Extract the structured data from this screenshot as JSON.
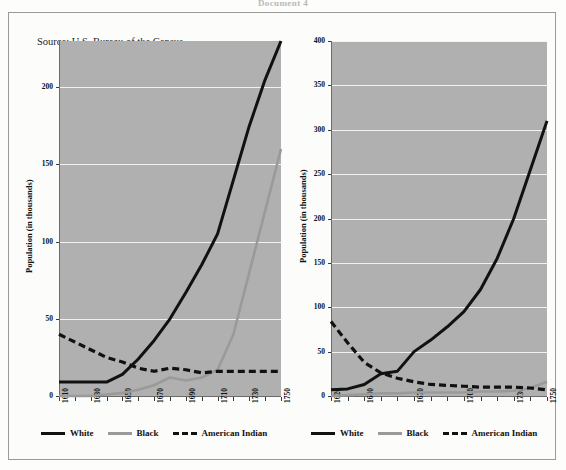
{
  "document": {
    "header": "Document 4",
    "source": "Source: U.S. Bureau of the Census"
  },
  "legend": {
    "items": [
      {
        "label": "White",
        "style": "solid-black",
        "color": "#111111"
      },
      {
        "label": "Black",
        "style": "solid-gray",
        "color": "#9a9a9a"
      },
      {
        "label": "American Indian",
        "style": "dashed-black",
        "color": "#111111"
      }
    ]
  },
  "chart_data": [
    {
      "id": "left-chart",
      "type": "line",
      "title": "",
      "xlabel": "",
      "ylabel": "Population (in thousands)",
      "xlim": [
        1610,
        1750
      ],
      "ylim": [
        0,
        230
      ],
      "yticks": [
        0,
        50,
        100,
        150,
        200
      ],
      "ytick_labels": [
        "0",
        "50",
        "100",
        "150",
        "200"
      ],
      "xticks": [
        1610,
        1620,
        1630,
        1640,
        1650,
        1660,
        1670,
        1680,
        1690,
        1700,
        1710,
        1720,
        1730,
        1740,
        1750
      ],
      "xtick_labels": [
        "1610",
        "",
        "1630",
        "",
        "1650",
        "",
        "1670",
        "",
        "1690",
        "",
        "1710",
        "",
        "1730",
        "",
        "1750"
      ],
      "grid": true,
      "legend_position": "below",
      "series": [
        {
          "name": "White",
          "color": "#111111",
          "dash": "none",
          "x": [
            1610,
            1620,
            1630,
            1640,
            1650,
            1660,
            1670,
            1680,
            1690,
            1700,
            1710,
            1720,
            1730,
            1740,
            1750
          ],
          "values": [
            9,
            9,
            9,
            9,
            14,
            24,
            36,
            50,
            67,
            85,
            105,
            140,
            175,
            205,
            230
          ]
        },
        {
          "name": "Black",
          "color": "#9a9a9a",
          "dash": "none",
          "x": [
            1610,
            1620,
            1630,
            1640,
            1650,
            1660,
            1670,
            1680,
            1690,
            1700,
            1710,
            1720,
            1730,
            1740,
            1750
          ],
          "values": [
            0,
            0,
            0,
            1,
            2,
            4,
            7,
            12,
            10,
            12,
            17,
            40,
            80,
            120,
            160
          ]
        },
        {
          "name": "American Indian",
          "color": "#111111",
          "dash": "dashed",
          "x": [
            1610,
            1620,
            1630,
            1640,
            1650,
            1660,
            1670,
            1680,
            1690,
            1700,
            1710,
            1720,
            1730,
            1740,
            1750
          ],
          "values": [
            40,
            35,
            30,
            25,
            22,
            18,
            16,
            18,
            17,
            15,
            16,
            16,
            16,
            16,
            16
          ]
        }
      ]
    },
    {
      "id": "right-chart",
      "type": "line",
      "title": "",
      "xlabel": "",
      "ylabel": "Population (in thousands)",
      "xlim": [
        1620,
        1750
      ],
      "ylim": [
        0,
        400
      ],
      "yticks": [
        0,
        50,
        100,
        150,
        200,
        250,
        300,
        350,
        400
      ],
      "ytick_labels": [
        "0",
        "50",
        "100",
        "150",
        "200",
        "250",
        "300",
        "350",
        "400"
      ],
      "xticks": [
        1620,
        1630,
        1640,
        1650,
        1660,
        1670,
        1680,
        1690,
        1700,
        1710,
        1720,
        1730,
        1740,
        1750
      ],
      "xtick_labels": [
        "1620",
        "",
        "1640",
        "",
        "",
        "1670",
        "",
        "",
        "1700",
        "",
        "",
        "1730",
        "",
        "1750"
      ],
      "grid": true,
      "legend_position": "below",
      "series": [
        {
          "name": "White",
          "color": "#111111",
          "dash": "none",
          "x": [
            1620,
            1630,
            1640,
            1650,
            1660,
            1670,
            1680,
            1690,
            1700,
            1710,
            1720,
            1730,
            1740,
            1750
          ],
          "values": [
            7,
            8,
            13,
            25,
            28,
            50,
            63,
            78,
            95,
            120,
            155,
            200,
            255,
            310
          ]
        },
        {
          "name": "Black",
          "color": "#9a9a9a",
          "dash": "none",
          "x": [
            1620,
            1630,
            1640,
            1650,
            1660,
            1670,
            1680,
            1690,
            1700,
            1710,
            1720,
            1730,
            1740,
            1750
          ],
          "values": [
            0,
            1,
            2,
            3,
            3,
            4,
            4,
            4,
            4,
            5,
            5,
            6,
            9,
            16
          ]
        },
        {
          "name": "American Indian",
          "color": "#111111",
          "dash": "dashed",
          "x": [
            1620,
            1630,
            1640,
            1650,
            1660,
            1670,
            1680,
            1690,
            1700,
            1710,
            1720,
            1730,
            1740,
            1750
          ],
          "values": [
            84,
            60,
            38,
            26,
            20,
            16,
            13,
            12,
            11,
            10,
            10,
            10,
            9,
            7
          ]
        }
      ]
    }
  ]
}
